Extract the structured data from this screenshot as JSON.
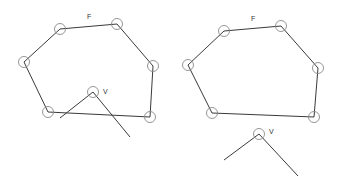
{
  "colors": {
    "edge": "#3a3a3a",
    "vertex_circle": "#8a8a8a",
    "label": "#333333",
    "background": "#ffffff"
  },
  "vertex_radius": 5.5,
  "panels": [
    {
      "id": "left",
      "polygon_label": "F",
      "polygon_label_pos": [
        87,
        19
      ],
      "polygon": [
        [
          60,
          29
        ],
        [
          117,
          24
        ],
        [
          153,
          66
        ],
        [
          150,
          117
        ],
        [
          48,
          112
        ],
        [
          24,
          62
        ]
      ],
      "wedge_label": "V",
      "wedge_label_pos": [
        103,
        94
      ],
      "wedge_apex": [
        93,
        92
      ],
      "wedge_ends": [
        [
          60,
          118
        ],
        [
          130,
          137
        ]
      ]
    },
    {
      "id": "right",
      "polygon_label": "F",
      "polygon_label_pos": [
        251,
        21
      ],
      "polygon": [
        [
          224,
          31
        ],
        [
          281,
          26
        ],
        [
          318,
          68
        ],
        [
          314,
          117
        ],
        [
          212,
          113
        ],
        [
          188,
          65
        ]
      ],
      "wedge_label": "V",
      "wedge_label_pos": [
        269,
        134
      ],
      "wedge_apex": [
        259,
        134
      ],
      "wedge_ends": [
        [
          224,
          160
        ],
        [
          298,
          176
        ]
      ]
    }
  ]
}
